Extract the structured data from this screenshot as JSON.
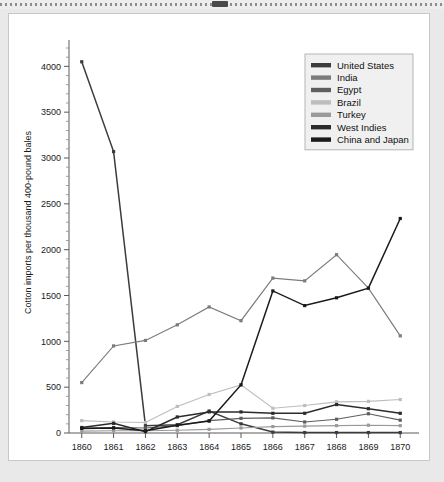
{
  "window": {
    "top_handle": "drag-handle"
  },
  "chart_data": {
    "type": "line",
    "title": "",
    "xlabel": "",
    "ylabel": "Cotton imports per thousand 400-pound bales",
    "categories": [
      "1860",
      "1861",
      "1862",
      "1863",
      "1864",
      "1865",
      "1866",
      "1867",
      "1868",
      "1869",
      "1870"
    ],
    "x": [
      1860,
      1861,
      1862,
      1863,
      1864,
      1865,
      1866,
      1867,
      1868,
      1869,
      1870
    ],
    "ylim": [
      0,
      4200
    ],
    "xlim": [
      1859.6,
      1870.4
    ],
    "yticks": [
      0,
      500,
      1000,
      1500,
      2000,
      2500,
      3000,
      3500,
      4000
    ],
    "ytick_labels": [
      "0",
      "500",
      "1000",
      "1500",
      "2000",
      "2500",
      "3000",
      "3500",
      "4000"
    ],
    "grid": false,
    "legend_position": "top-right",
    "series": [
      {
        "name": "United States",
        "color": "#3c3c3c",
        "values": [
          4050,
          3070,
          80,
          90,
          240,
          100,
          10,
          5,
          5,
          5,
          5
        ]
      },
      {
        "name": "India",
        "color": "#7b7b7b",
        "values": [
          550,
          950,
          1010,
          1180,
          1375,
          1225,
          1690,
          1660,
          1945,
          1580,
          1060
        ]
      },
      {
        "name": "Egypt",
        "color": "#5e5e5e",
        "values": [
          55,
          60,
          55,
          80,
          135,
          160,
          165,
          120,
          150,
          210,
          140
        ]
      },
      {
        "name": "Brazil",
        "color": "#bdbdbd",
        "values": [
          135,
          120,
          115,
          290,
          420,
          525,
          270,
          300,
          340,
          345,
          365
        ]
      },
      {
        "name": "Turkey",
        "color": "#9a9a9a",
        "values": [
          20,
          25,
          25,
          30,
          40,
          55,
          70,
          75,
          80,
          85,
          80
        ]
      },
      {
        "name": "West Indies",
        "color": "#2b2b2b",
        "values": [
          60,
          105,
          15,
          175,
          230,
          230,
          215,
          215,
          310,
          265,
          215
        ]
      },
      {
        "name": "China and Japan",
        "color": "#1a1a1a",
        "values": [
          50,
          55,
          25,
          85,
          130,
          525,
          1550,
          1390,
          1475,
          1580,
          2340
        ]
      }
    ]
  }
}
